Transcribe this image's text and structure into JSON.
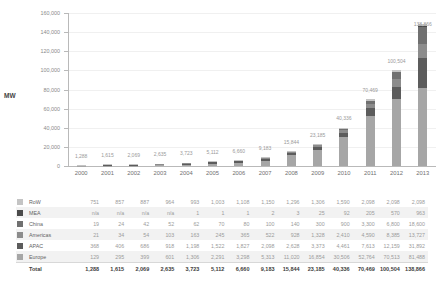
{
  "chart_data": {
    "type": "bar",
    "stacked": true,
    "title": "",
    "xlabel": "",
    "ylabel": "MW",
    "ylim": [
      0,
      160000
    ],
    "ytick_labels": [
      "160,000",
      "140,000",
      "120,000",
      "100,000",
      "80,000",
      "60,000",
      "40,000",
      "20,000",
      "0"
    ],
    "ytick_values": [
      160000,
      140000,
      120000,
      100000,
      80000,
      60000,
      40000,
      20000,
      0
    ],
    "grid": true,
    "legend_position": "table-left",
    "categories": [
      "2000",
      "2001",
      "2002",
      "2003",
      "2004",
      "2005",
      "2006",
      "2007",
      "2008",
      "2009",
      "2010",
      "2011",
      "2012",
      "2013"
    ],
    "series": [
      {
        "name": "Europe",
        "color": "#a6a6a6",
        "values": [
          129,
          295,
          399,
          601,
          1306,
          2291,
          3298,
          5313,
          11020,
          16854,
          30506,
          52764,
          70513,
          81488
        ]
      },
      {
        "name": "APAC",
        "color": "#5c5c5c",
        "values": [
          368,
          406,
          686,
          918,
          1198,
          1522,
          1827,
          2098,
          2628,
          3373,
          4461,
          7613,
          12159,
          31892
        ]
      },
      {
        "name": "Americas",
        "color": "#8c8c8c",
        "values": [
          21,
          34,
          54,
          103,
          163,
          245,
          365,
          522,
          928,
          1328,
          2410,
          4590,
          8385,
          13727
        ]
      },
      {
        "name": "China",
        "color": "#707070",
        "values": [
          19,
          24,
          42,
          52,
          62,
          70,
          80,
          100,
          140,
          300,
          900,
          3300,
          6800,
          18600
        ]
      },
      {
        "name": "MEA",
        "color": "#4a4a4a",
        "values": [
          "n/a",
          "n/a",
          "n/a",
          "n/a",
          1,
          1,
          1,
          2,
          3,
          25,
          92,
          205,
          570,
          963
        ]
      },
      {
        "name": "RoW",
        "color": "#c4c4c4",
        "values": [
          751,
          857,
          887,
          964,
          993,
          1003,
          1108,
          1150,
          1296,
          1306,
          1590,
          2098,
          2098,
          2098
        ]
      }
    ],
    "totals": [
      1288,
      1615,
      2069,
      2635,
      3723,
      5112,
      6660,
      9183,
      15844,
      23185,
      40336,
      70469,
      100504,
      138866
    ],
    "total_labels": [
      "1,288",
      "1,615",
      "2,069",
      "2,635",
      "3,723",
      "5,112",
      "6,660",
      "9,183",
      "15,844",
      "23,185",
      "40,336",
      "70,469",
      "100,504",
      "138,866"
    ]
  },
  "table": {
    "rows": [
      {
        "label": "RoW",
        "swatch": "#c4c4c4",
        "values": [
          "751",
          "857",
          "887",
          "964",
          "993",
          "1,003",
          "1,108",
          "1,150",
          "1,296",
          "1,306",
          "1,590",
          "2,098",
          "2,098",
          "2,098"
        ]
      },
      {
        "label": "MEA",
        "swatch": "#4a4a4a",
        "values": [
          "n/a",
          "n/a",
          "n/a",
          "n/a",
          "1",
          "1",
          "1",
          "2",
          "3",
          "25",
          "92",
          "205",
          "570",
          "963"
        ]
      },
      {
        "label": "China",
        "swatch": "#707070",
        "values": [
          "19",
          "24",
          "42",
          "52",
          "62",
          "70",
          "80",
          "100",
          "140",
          "300",
          "900",
          "3,300",
          "6,800",
          "18,600"
        ]
      },
      {
        "label": "Americas",
        "swatch": "#8c8c8c",
        "values": [
          "21",
          "34",
          "54",
          "103",
          "163",
          "245",
          "365",
          "522",
          "928",
          "1,328",
          "2,410",
          "4,590",
          "8,385",
          "13,727"
        ]
      },
      {
        "label": "APAC",
        "swatch": "#5c5c5c",
        "values": [
          "368",
          "406",
          "686",
          "918",
          "1,198",
          "1,522",
          "1,827",
          "2,098",
          "2,628",
          "3,373",
          "4,461",
          "7,613",
          "12,159",
          "31,892"
        ]
      },
      {
        "label": "Europe",
        "swatch": "#a6a6a6",
        "values": [
          "129",
          "295",
          "399",
          "601",
          "1,306",
          "2,291",
          "3,298",
          "5,313",
          "11,020",
          "16,854",
          "30,506",
          "52,764",
          "70,513",
          "81,488"
        ]
      },
      {
        "label": "Total",
        "swatch": null,
        "values": [
          "1,288",
          "1,615",
          "2,069",
          "2,635",
          "3,723",
          "5,112",
          "6,660",
          "9,183",
          "15,844",
          "23,185",
          "40,336",
          "70,469",
          "100,504",
          "138,866"
        ]
      }
    ]
  }
}
